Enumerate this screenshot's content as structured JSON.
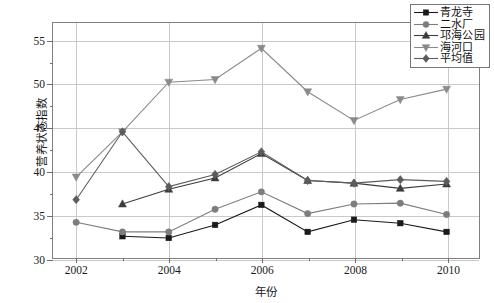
{
  "chart_data": {
    "type": "line",
    "title": "",
    "xlabel": "年份",
    "ylabel": "营养状态指数",
    "x": [
      2002,
      2003,
      2004,
      2005,
      2006,
      2007,
      2008,
      2009,
      2010
    ],
    "xtick_labels": [
      "2002",
      "2004",
      "2006",
      "2008",
      "2010"
    ],
    "xticks": [
      2002,
      2004,
      2006,
      2008,
      2010
    ],
    "ytick_labels": [
      "30",
      "35",
      "40",
      "45",
      "50",
      "55"
    ],
    "yticks": [
      30,
      35,
      40,
      45,
      50,
      55
    ],
    "xlim": [
      2001.5,
      2010.7
    ],
    "ylim": [
      30,
      57
    ],
    "grid": "both",
    "legend_position": "top-right",
    "series": [
      {
        "name": "青龙寺",
        "marker": "square",
        "color": "#1a1a1a",
        "x": [
          2003,
          2004,
          2005,
          2006,
          2007,
          2008,
          2009,
          2010
        ],
        "values": [
          32.5,
          32.3,
          33.8,
          36.1,
          33.0,
          34.4,
          34.0,
          33.0
        ]
      },
      {
        "name": "二水厂",
        "marker": "circle",
        "color": "#7d7d7d",
        "x": [
          2002,
          2003,
          2004,
          2005,
          2006,
          2007,
          2008,
          2009,
          2010
        ],
        "values": [
          34.1,
          33.0,
          33.0,
          35.6,
          37.6,
          35.1,
          36.2,
          36.3,
          35.0
        ]
      },
      {
        "name": "邛海公园",
        "marker": "triangle-up",
        "color": "#3d3d3d",
        "x": [
          2003,
          2004,
          2005,
          2006,
          2007,
          2008,
          2009,
          2010
        ],
        "values": [
          36.2,
          37.9,
          39.2,
          42.0,
          38.9,
          38.6,
          38.0,
          38.5
        ]
      },
      {
        "name": "海河口",
        "marker": "triangle-down",
        "color": "#8a8a8a",
        "x": [
          2002,
          2003,
          2004,
          2005,
          2006,
          2007,
          2008,
          2009,
          2010
        ],
        "values": [
          39.3,
          44.5,
          50.2,
          50.5,
          54.1,
          49.1,
          45.8,
          48.2,
          49.4
        ]
      },
      {
        "name": "平均值",
        "marker": "diamond",
        "color": "#5c5c5c",
        "x": [
          2002,
          2003,
          2004,
          2005,
          2006,
          2007,
          2008,
          2009,
          2010
        ],
        "values": [
          36.7,
          44.5,
          38.2,
          39.6,
          42.2,
          38.9,
          38.6,
          39.0,
          38.8
        ]
      }
    ]
  },
  "legend": {
    "items": [
      {
        "label": "青龙寺"
      },
      {
        "label": "二水厂"
      },
      {
        "label": "邛海公园"
      },
      {
        "label": "海河口"
      },
      {
        "label": "平均值"
      }
    ]
  }
}
